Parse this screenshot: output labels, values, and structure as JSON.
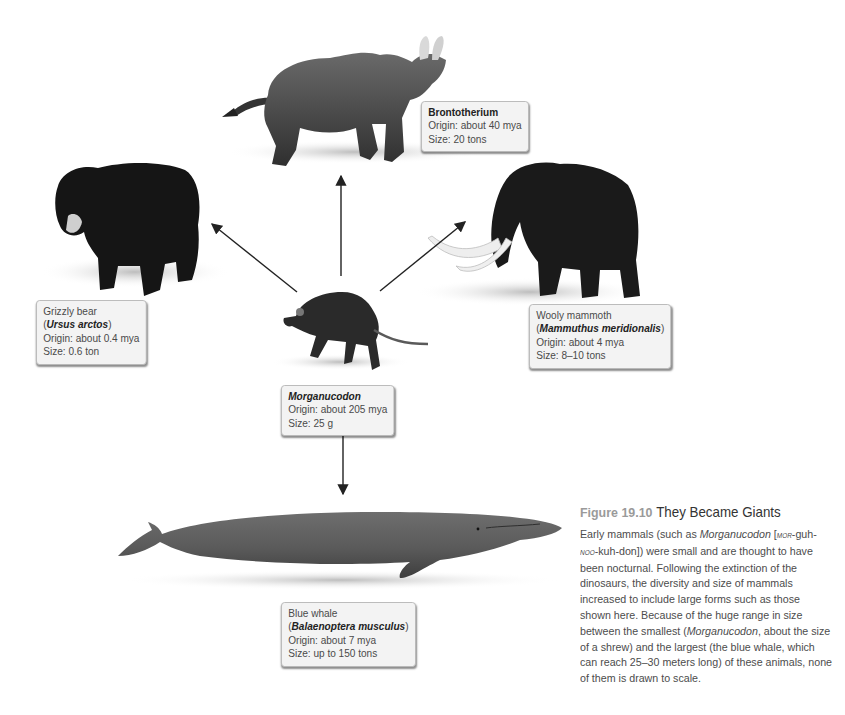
{
  "figure": {
    "number": "Figure 19.10",
    "title": "They Became Giants",
    "caption_parts": {
      "p1": "Early mammals (such as ",
      "morg_italic": "Morganucodon",
      "p2": " [",
      "pron1_sc": "mor",
      "pron2": "-guh-",
      "pron3_sc": "noo",
      "pron4": "-kuh-don]) were small and are thought to have been nocturnal. Following the extinction of the dinosaurs, the diversity and size of mammals increased to include large forms such as those shown here. Because of the huge range in size between the smallest (",
      "morg_italic2": "Morganucodon",
      "p3": ", about the size of a shrew) and the largest (the blue whale, which can reach 25–30 meters long) of these animals, none of them is drawn to scale."
    }
  },
  "center_animal": {
    "name": "Morganucodon",
    "origin": "Origin: about 205 mya",
    "size": "Size: 25 g"
  },
  "animals": {
    "brontotherium": {
      "name": "Brontotherium",
      "origin": "Origin: about 40 mya",
      "size": "Size: 20 tons"
    },
    "grizzly": {
      "common": "Grizzly bear",
      "sci_open": "(",
      "scientific": "Ursus arctos",
      "sci_close": ")",
      "origin": "Origin: about 0.4 mya",
      "size": "Size: 0.6 ton"
    },
    "mammoth": {
      "common": "Wooly mammoth",
      "sci_open": "(",
      "scientific": "Mammuthus meridionalis",
      "sci_close": ")",
      "origin": "Origin: about 4 mya",
      "size": "Size: 8–10 tons"
    },
    "whale": {
      "common": "Blue whale",
      "sci_open": "(",
      "scientific": "Balaenoptera musculus",
      "sci_close": ")",
      "origin": "Origin: about 7 mya",
      "size": "Size: up to 150 tons"
    }
  },
  "arrows": [
    {
      "from": "Morganucodon",
      "to": "Brontotherium"
    },
    {
      "from": "Morganucodon",
      "to": "Grizzly bear"
    },
    {
      "from": "Morganucodon",
      "to": "Wooly mammoth"
    },
    {
      "from": "Morganucodon",
      "to": "Blue whale"
    }
  ]
}
